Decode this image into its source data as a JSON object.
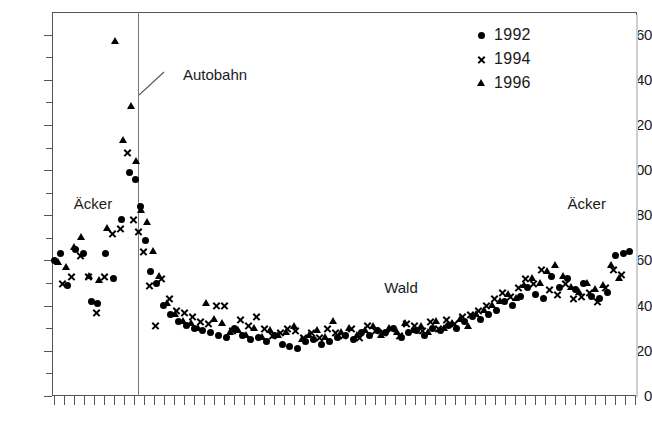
{
  "chart_data": {
    "type": "scatter",
    "title": "",
    "xlabel": "",
    "ylabel": "",
    "ylim": [
      0,
      170
    ],
    "yticks": [
      0,
      20,
      40,
      60,
      80,
      100,
      120,
      140,
      160
    ],
    "ytick_labels": [
      "0",
      "20",
      "40",
      "60",
      "80",
      "100",
      "120",
      "140",
      "160"
    ],
    "yminor_step": 10,
    "xlim": [
      0,
      59
    ],
    "xtick_count": 58,
    "xtick_labels": [],
    "grid": false,
    "legend_position": "top-right",
    "annotations": [
      {
        "text": "Autobahn",
        "x": 13.2,
        "y": 142,
        "kind": "leader-label"
      },
      {
        "text": "Äcker",
        "x": 2.2,
        "y": 85,
        "kind": "region-label"
      },
      {
        "text": "Wald",
        "x": 33.5,
        "y": 48,
        "kind": "region-label"
      },
      {
        "text": "Äcker",
        "x": 52.0,
        "y": 85,
        "kind": "region-label"
      }
    ],
    "vertical_line": {
      "x": 8.6,
      "label": "Autobahn"
    },
    "series": [
      {
        "name": "1992",
        "marker": "circle",
        "color": "#000000",
        "x": [
          0.3,
          0.9,
          1.6,
          2.4,
          3.2,
          4.0,
          4.6,
          5.4,
          6.2,
          7.0,
          7.8,
          8.4,
          8.9,
          9.4,
          9.9,
          10.5,
          11.2,
          12.0,
          12.8,
          13.6,
          14.4,
          15.2,
          16.0,
          16.8,
          17.6,
          18.4,
          19.2,
          20.0,
          20.8,
          21.6,
          22.4,
          23.2,
          24.0,
          24.8,
          25.6,
          26.4,
          27.2,
          28.0,
          28.8,
          29.6,
          30.4,
          31.2,
          32.0,
          32.8,
          33.6,
          34.4,
          35.2,
          36.0,
          36.8,
          37.6,
          38.4,
          39.2,
          40.0,
          40.8,
          41.6,
          42.4,
          43.2,
          44.0,
          44.8,
          45.6,
          46.4,
          47.2,
          48.0,
          48.8,
          49.6,
          50.4,
          51.2,
          52.0,
          52.8,
          53.6,
          54.4,
          55.2,
          56.0,
          56.8,
          57.6,
          58.2
        ],
        "y": [
          60,
          63,
          49,
          65,
          63,
          42,
          41,
          63,
          52,
          78,
          99,
          96,
          84,
          69,
          55,
          50,
          40,
          36,
          33,
          31,
          30,
          29,
          28,
          27,
          26,
          30,
          27,
          25,
          26,
          24,
          27,
          23,
          22,
          21,
          24,
          25,
          23,
          24,
          26,
          27,
          25,
          28,
          27,
          29,
          28,
          30,
          26,
          28,
          29,
          27,
          30,
          29,
          31,
          30,
          33,
          35,
          34,
          36,
          38,
          42,
          40,
          44,
          48,
          45,
          43,
          53,
          48,
          52,
          47,
          50,
          44,
          43,
          46,
          62,
          63,
          64
        ]
      },
      {
        "name": "1994",
        "marker": "cross",
        "color": "#000000",
        "x": [
          1.1,
          2.0,
          2.9,
          3.7,
          4.5,
          5.3,
          6.1,
          6.9,
          7.6,
          8.2,
          8.7,
          9.2,
          9.8,
          10.4,
          11.0,
          11.8,
          12.6,
          13.4,
          14.2,
          15.0,
          15.8,
          16.6,
          17.4,
          18.2,
          19.0,
          19.8,
          20.6,
          21.4,
          22.2,
          23.0,
          23.8,
          24.6,
          25.4,
          26.2,
          27.0,
          27.8,
          28.6,
          29.4,
          30.2,
          31.0,
          31.8,
          32.6,
          33.4,
          34.2,
          35.0,
          35.8,
          36.6,
          37.4,
          38.2,
          39.0,
          39.8,
          40.6,
          41.4,
          42.2,
          43.0,
          43.8,
          44.6,
          45.4,
          46.2,
          47.0,
          47.8,
          48.6,
          49.4,
          50.2,
          51.0,
          51.8,
          52.6,
          53.4,
          54.2,
          55.0,
          55.8,
          56.6,
          57.4
        ],
        "y": [
          50,
          53,
          62,
          53,
          37,
          53,
          72,
          74,
          108,
          78,
          73,
          64,
          49,
          31,
          52,
          43,
          38,
          37,
          35,
          33,
          32,
          40,
          40,
          29,
          34,
          31,
          35,
          30,
          27,
          28,
          30,
          29,
          26,
          28,
          26,
          30,
          28,
          27,
          30,
          26,
          31,
          29,
          28,
          30,
          27,
          32,
          31,
          29,
          33,
          30,
          34,
          32,
          35,
          36,
          38,
          40,
          43,
          46,
          44,
          48,
          52,
          50,
          56,
          47,
          45,
          50,
          43,
          44,
          46,
          42,
          48,
          56,
          54
        ]
      },
      {
        "name": "1996",
        "marker": "triangle",
        "color": "#000000",
        "x": [
          0.6,
          1.4,
          2.2,
          3.0,
          3.8,
          4.8,
          5.6,
          6.4,
          7.2,
          8.0,
          8.5,
          9.0,
          9.6,
          10.2,
          10.8,
          11.6,
          12.4,
          13.2,
          14.0,
          14.8,
          15.6,
          16.4,
          17.2,
          18.0,
          18.8,
          19.6,
          20.4,
          21.2,
          22.0,
          22.8,
          23.6,
          24.4,
          25.2,
          26.0,
          26.8,
          27.6,
          28.4,
          29.2,
          30.0,
          30.8,
          31.6,
          32.4,
          33.2,
          34.0,
          34.8,
          35.6,
          36.4,
          37.2,
          38.0,
          38.8,
          39.6,
          40.4,
          41.2,
          42.0,
          42.8,
          43.6,
          44.4,
          45.2,
          46.0,
          46.8,
          47.6,
          48.4,
          49.2,
          50.0,
          50.8,
          51.6,
          52.4,
          53.2,
          54.0,
          54.8,
          55.6,
          56.4,
          57.2
        ],
        "y": [
          59,
          57,
          66,
          70,
          53,
          51,
          74,
          157,
          113,
          128,
          104,
          82,
          77,
          64,
          53,
          41,
          36,
          33,
          32,
          30,
          41,
          34,
          32,
          28,
          29,
          27,
          30,
          26,
          29,
          27,
          28,
          31,
          25,
          27,
          29,
          26,
          33,
          28,
          30,
          27,
          29,
          31,
          27,
          30,
          28,
          32,
          29,
          31,
          28,
          33,
          30,
          32,
          34,
          31,
          36,
          38,
          40,
          42,
          45,
          43,
          49,
          52,
          50,
          55,
          58,
          53,
          48,
          46,
          50,
          47,
          49,
          58,
          52
        ]
      }
    ]
  }
}
